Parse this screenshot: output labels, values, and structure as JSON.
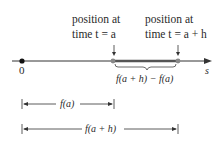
{
  "diagram": {
    "type": "number-line",
    "axis_label": "s",
    "origin_label": "0",
    "points": [
      {
        "label_line1": "position at",
        "label_line2": "time t = a"
      },
      {
        "label_line1": "position at",
        "label_line2": "time t = a + h"
      }
    ],
    "brace_label": "f(a + h) − f(a)",
    "distances": [
      {
        "label": "f(a)"
      },
      {
        "label": "f(a + h)"
      }
    ],
    "colors": {
      "line": "#333333",
      "segment": "#555555",
      "point": "#777777"
    }
  }
}
